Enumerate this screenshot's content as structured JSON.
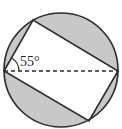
{
  "diagram": {
    "angle_label": "55°",
    "colors": {
      "shaded": "#c8c8c8",
      "stroke": "#2a2a2a",
      "background": "#ffffff"
    },
    "circle": {
      "cx": 61,
      "cy": 70,
      "r": 57
    },
    "points": {
      "left": {
        "x": 4,
        "y": 71
      },
      "top": {
        "x": 33,
        "y": 20
      },
      "right": {
        "x": 118,
        "y": 71
      },
      "bottom": {
        "x": 89,
        "y": 121
      }
    },
    "elements": [
      "circle",
      "inscribed rectangle",
      "dashed diagonal (diameter)",
      "angle arc 55°",
      "shaded circular segments"
    ]
  }
}
